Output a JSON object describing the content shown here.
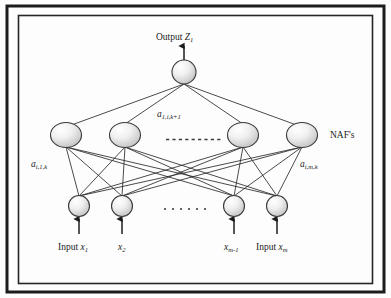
{
  "figure": {
    "kind": "neural-network-diagram",
    "frame": {
      "border_color": "#1c1c1c",
      "background": "#fdfdfd"
    }
  },
  "colors": {
    "node_stroke": "#3a3a3a",
    "node_fill_light": "#ffffff",
    "node_fill_dark": "#c4c4c4",
    "edge": "#2b2b2b",
    "text": "#1a1a1a"
  },
  "labels": {
    "output": {
      "text_prefix": "Output",
      "symbol": "Z",
      "subscript": "1"
    },
    "hidden_weight": {
      "symbol": "a",
      "subscript": "1,i,k+1"
    },
    "left_weight": {
      "symbol": "a",
      "subscript": "i,1,k"
    },
    "right_weight": {
      "symbol": "a",
      "subscript": "i,m,k"
    },
    "naf": "NAF's",
    "inputs": [
      {
        "prefix": "Input",
        "symbol": "x",
        "subscript": "1"
      },
      {
        "prefix": "",
        "symbol": "x",
        "subscript": "2"
      },
      {
        "prefix": "",
        "symbol": "x",
        "subscript": "m-1"
      },
      {
        "prefix": "Input",
        "symbol": "x",
        "subscript": "m"
      }
    ],
    "hidden_ellipsis": "- - - - - - - - -",
    "input_ellipsis": "• • • • • •"
  },
  "network": {
    "layers": [
      {
        "name": "output-layer",
        "node_count": 1,
        "nodes": [
          {
            "id": "out-1",
            "cx": 184,
            "cy": 72,
            "rx": 12,
            "ry": 12
          }
        ]
      },
      {
        "name": "hidden-layer",
        "node_count": 4,
        "note": "NAF's layer, ellipsis between node 2 and node 3",
        "nodes": [
          {
            "id": "h-1",
            "cx": 66,
            "cy": 135,
            "rx": 15.5,
            "ry": 12.5
          },
          {
            "id": "h-2",
            "cx": 125,
            "cy": 135,
            "rx": 15.5,
            "ry": 12.5
          },
          {
            "id": "h-3",
            "cx": 243,
            "cy": 135,
            "rx": 15.5,
            "ry": 12.5
          },
          {
            "id": "h-4",
            "cx": 302,
            "cy": 135,
            "rx": 15.5,
            "ry": 12.5
          }
        ]
      },
      {
        "name": "input-layer",
        "node_count": 4,
        "nodes": [
          {
            "id": "i-1",
            "cx": 79,
            "cy": 206,
            "rx": 10.5,
            "ry": 10.5
          },
          {
            "id": "i-2",
            "cx": 122,
            "cy": 206,
            "rx": 10.5,
            "ry": 10.5
          },
          {
            "id": "i-3",
            "cx": 234,
            "cy": 206,
            "rx": 10.5,
            "ry": 10.5
          },
          {
            "id": "i-4",
            "cx": 277,
            "cy": 206,
            "rx": 10.5,
            "ry": 10.5
          }
        ]
      }
    ],
    "connections": {
      "input_to_hidden": "fully-connected 4x4",
      "hidden_to_output": "all 4 hidden nodes to single output node"
    },
    "arrows": [
      {
        "name": "output-arrow",
        "from": [
          184,
          60
        ],
        "to": [
          184,
          44
        ],
        "direction": "up"
      },
      {
        "name": "input-arrow-1",
        "from": [
          79,
          234
        ],
        "to": [
          79,
          217
        ],
        "direction": "up"
      },
      {
        "name": "input-arrow-2",
        "from": [
          122,
          234
        ],
        "to": [
          122,
          217
        ],
        "direction": "up"
      },
      {
        "name": "input-arrow-3",
        "from": [
          234,
          234
        ],
        "to": [
          234,
          217
        ],
        "direction": "up"
      },
      {
        "name": "input-arrow-4",
        "from": [
          277,
          234
        ],
        "to": [
          277,
          217
        ],
        "direction": "up"
      }
    ]
  }
}
